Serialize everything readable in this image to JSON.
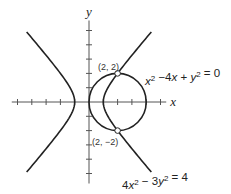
{
  "figure": {
    "x_axis_label": "x",
    "y_axis_label": "y",
    "origin_px": [
      89,
      102
    ],
    "unit_px": 14.3,
    "x_ticks": [
      -5,
      -4,
      -3,
      -2,
      -1,
      1,
      2,
      3,
      4,
      5
    ],
    "y_ticks": [
      -5,
      -4,
      -3,
      -2,
      -1,
      1,
      2,
      3,
      4,
      5
    ],
    "x_range": [
      -5.4,
      5.4
    ],
    "y_range": [
      -5.7,
      5.7
    ],
    "curves": [
      {
        "name": "circle",
        "equation": {
          "parts": [
            {
              "t": "x",
              "i": true
            },
            {
              "t": "2",
              "sup": true
            },
            {
              "t": " −4"
            },
            {
              "t": "x",
              "i": true
            },
            {
              "t": " + "
            },
            {
              "t": "y",
              "i": true
            },
            {
              "t": "2",
              "sup": true
            },
            {
              "t": " = 0"
            }
          ]
        },
        "center": [
          2,
          0
        ],
        "radius": 2
      },
      {
        "name": "hyperbola",
        "equation": {
          "parts": [
            {
              "t": "4"
            },
            {
              "t": "x",
              "i": true
            },
            {
              "t": "2",
              "sup": true
            },
            {
              "t": " − 3"
            },
            {
              "t": "y",
              "i": true
            },
            {
              "t": "2",
              "sup": true
            },
            {
              "t": " = 4"
            }
          ]
        },
        "a": 1,
        "b_sq": 1.3333,
        "y_extent": 4.9
      }
    ],
    "intersection_points": [
      {
        "label": "(2, 2)",
        "x": 2,
        "y": 2
      },
      {
        "label": "(2, −2)",
        "x": 2,
        "y": -2
      }
    ]
  }
}
